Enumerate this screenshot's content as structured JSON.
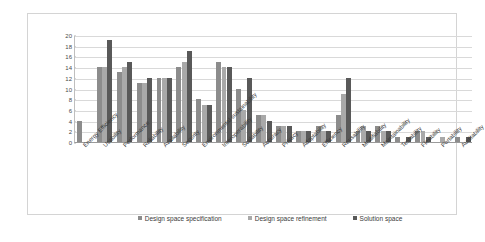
{
  "chart_data": {
    "type": "bar",
    "title": "",
    "subtitle": "",
    "xlabel": "",
    "ylabel": "",
    "ylim": [
      0,
      20
    ],
    "ytick_step": 2,
    "yticks": [
      20,
      18,
      16,
      14,
      12,
      10,
      8,
      6,
      4,
      2,
      0
    ],
    "grid": true,
    "legend_position": "bottom",
    "orientation": "vertical",
    "grouped": true,
    "categories": [
      "Energy Efficiency",
      "Usability",
      "Performance",
      "Reliability",
      "Availability",
      "Security",
      "Environmental sustainability",
      "Interoperability",
      "Scalability",
      "Accuracy",
      "Privacy",
      "Adaptability",
      "Efficiency",
      "Reusability",
      "Modifiability",
      "Maintainability",
      "Testability",
      "Flexibility",
      "Portability",
      "Auditability"
    ],
    "series": [
      {
        "name": "Design space specification",
        "color": "#8c8c8c",
        "values": [
          4,
          14,
          13,
          11,
          12,
          14,
          8,
          15,
          10,
          5,
          3,
          2,
          3,
          5,
          2,
          3,
          1,
          2,
          0,
          1
        ]
      },
      {
        "name": "Design space refinement",
        "color": "#a9a9a9",
        "values": [
          0,
          14,
          14,
          11,
          12,
          15,
          7,
          14,
          6,
          5,
          3,
          2,
          2,
          9,
          3,
          2,
          0,
          2,
          1,
          0
        ]
      },
      {
        "name": "Solution space",
        "color": "#595959",
        "values": [
          0,
          19,
          15,
          12,
          12,
          17,
          7,
          14,
          12,
          4,
          3,
          2,
          2,
          12,
          2,
          2,
          1,
          1,
          0,
          1
        ]
      }
    ]
  },
  "legend": {
    "items": [
      {
        "label": "Design space specification",
        "series": 0
      },
      {
        "label": "Design space refinement",
        "series": 1
      },
      {
        "label": "Solution space",
        "series": 2
      }
    ]
  }
}
